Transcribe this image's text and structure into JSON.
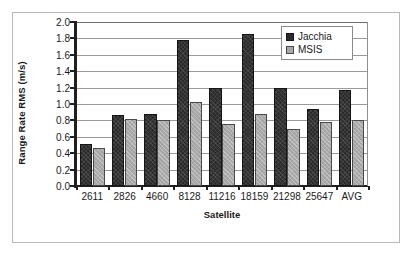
{
  "chart_data": {
    "type": "bar",
    "title": "",
    "xlabel": "Satellite",
    "ylabel": "Range Rate RMS (m/s)",
    "categories": [
      "2611",
      "2826",
      "4660",
      "8128",
      "11216",
      "18159",
      "21298",
      "25647",
      "AVG"
    ],
    "series": [
      {
        "name": "Jacchia",
        "color": "#2b2b2b",
        "values": [
          0.51,
          0.86,
          0.88,
          1.78,
          1.2,
          1.85,
          1.2,
          0.94,
          1.17
        ]
      },
      {
        "name": "MSIS",
        "color": "#a9a9a9",
        "values": [
          0.46,
          0.82,
          0.81,
          1.03,
          0.76,
          0.88,
          0.7,
          0.78,
          0.8
        ]
      }
    ],
    "ylim": [
      0.0,
      2.0
    ],
    "yticks": [
      "0.0",
      "0.2",
      "0.4",
      "0.6",
      "0.8",
      "1.0",
      "1.2",
      "1.4",
      "1.6",
      "1.8",
      "2.0"
    ],
    "ytick_values": [
      0.0,
      0.2,
      0.4,
      0.6,
      0.8,
      1.0,
      1.2,
      1.4,
      1.6,
      1.8,
      2.0
    ],
    "grid": "horizontal",
    "legend_position": "upper-right-inside",
    "legend_entries": [
      "Jacchia",
      "MSIS"
    ]
  }
}
